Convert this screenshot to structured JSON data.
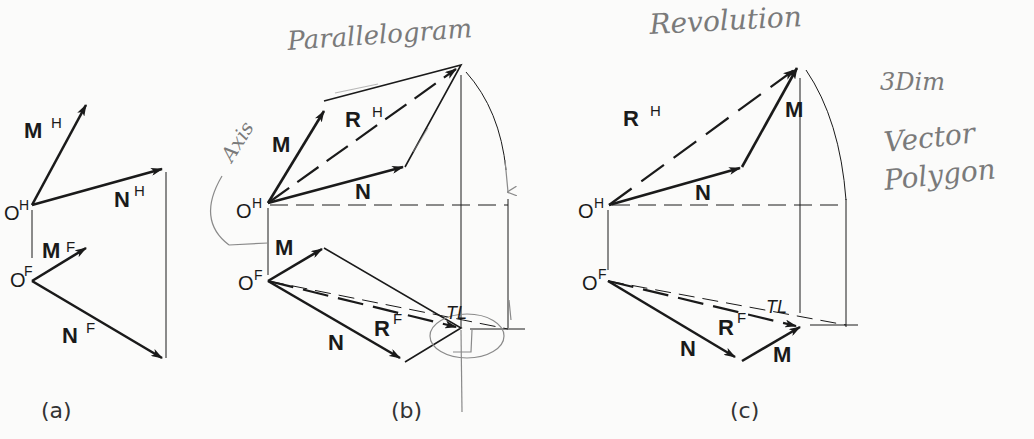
{
  "figure": {
    "panels": [
      {
        "id": "a",
        "caption": "(a)",
        "labels": {
          "M_top": "M",
          "M_top_sup": "H",
          "N_top": "N",
          "N_top_sup": "H",
          "O_top": "O",
          "O_top_sup": "H",
          "M_front": "M",
          "M_front_sup": "F",
          "N_front": "N",
          "N_front_sup": "F",
          "O_front": "O",
          "O_front_sup": "F"
        }
      },
      {
        "id": "b",
        "caption": "(b)",
        "method_annotation": "Parallelogram",
        "labels": {
          "M_top": "M",
          "R_top": "R",
          "R_top_sup": "H",
          "N_top": "N",
          "O_top": "O",
          "O_top_sup": "H",
          "M_front": "M",
          "O_front": "O",
          "O_front_sup": "F",
          "N_front": "N",
          "R_front": "R",
          "R_front_sup": "F",
          "TL": "TL"
        },
        "handwritten_axis": "Axis"
      },
      {
        "id": "c",
        "caption": "(c)",
        "method_annotation": "Revolution",
        "labels": {
          "R_top": "R",
          "R_top_sup": "H",
          "M_top": "M",
          "N_top": "N",
          "O_top": "O",
          "O_top_sup": "H",
          "O_front": "O",
          "O_front_sup": "F",
          "R_front": "R",
          "R_front_sup": "F",
          "N_front": "N",
          "M_front": "M",
          "TL": "TL"
        }
      }
    ],
    "side_notes": {
      "line1": "3Dim",
      "line2": "Vector",
      "line3": "Polygon"
    },
    "colors": {
      "ink": "#1a1a1a",
      "pencil": "#8a8a8a",
      "paper": "#fbfbfa"
    }
  }
}
